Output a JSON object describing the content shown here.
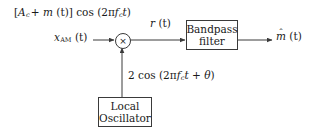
{
  "diagram": {
    "stroke_color": "#3a3a3a",
    "text_color": "#1a1a1a",
    "background": "#ffffff",
    "labels": {
      "carrier_expression": {
        "open_bracket": "[",
        "amplitude_symbol": "A",
        "amplitude_subscript": "c",
        "plus": "+",
        "message_symbol": "m",
        "message_arg": "(t)",
        "close_bracket": "]",
        "cos": "cos",
        "cos_open": "(2π",
        "freq_symbol": "f",
        "freq_subscript": "c",
        "time_symbol": "t",
        "cos_close": ")"
      },
      "input_signal": {
        "symbol": "x",
        "subscript": "AM",
        "arg": "(t)"
      },
      "intermediate_signal": {
        "symbol": "r",
        "arg": "(t)"
      },
      "output_signal": {
        "accent": "ˆ",
        "symbol": "m",
        "arg": "(t)"
      },
      "oscillator_expression": {
        "gain": "2",
        "cos": "cos",
        "cos_open": "(2π",
        "freq_symbol": "f",
        "freq_subscript": "c",
        "time_symbol": "t",
        "plus": "+",
        "phase_symbol": "θ",
        "cos_close": ")"
      }
    },
    "blocks": {
      "bandpass_filter": {
        "line1": "Bandpass",
        "line2": "filter"
      },
      "local_oscillator": {
        "line1": "Local",
        "line2": "Oscillator"
      },
      "multiplier": {
        "glyph": "×"
      }
    }
  }
}
